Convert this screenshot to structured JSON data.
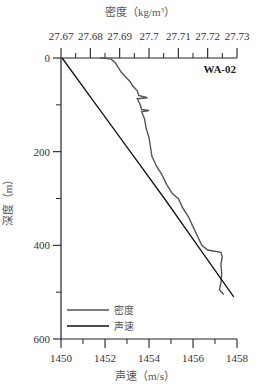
{
  "chart_data": {
    "type": "line",
    "title": "WA-02",
    "station_label": "WA-02",
    "top_axis": {
      "label": "密度（kg/m³）",
      "label_main": "密度（kg/m",
      "label_sup": "3",
      "label_close": "）",
      "ticks": [
        "27.67",
        "27.68",
        "27.69",
        "27.7",
        "27.71",
        "27.72",
        "27.73"
      ],
      "range": [
        27.67,
        27.73
      ]
    },
    "bottom_axis": {
      "label": "声速（m/s）",
      "ticks": [
        "1450",
        "1452",
        "1454",
        "1456",
        "1458"
      ],
      "range": [
        1450,
        1458
      ]
    },
    "y_axis": {
      "label": "深度（m）",
      "ticks": [
        "0",
        "200",
        "400",
        "600"
      ],
      "minor_ticks": [
        100,
        300,
        500
      ],
      "range": [
        0,
        600
      ],
      "inverted": true
    },
    "legend": {
      "position": "lower-left",
      "entries": [
        {
          "name": "密度",
          "color": "#555555"
        },
        {
          "name": "声速",
          "color": "#111111"
        }
      ]
    },
    "series": [
      {
        "name": "密度",
        "axis": "top",
        "color": "#555555",
        "points": [
          {
            "depth": 0,
            "value": 27.6833
          },
          {
            "depth": 2,
            "value": 27.687
          },
          {
            "depth": 10,
            "value": 27.6885
          },
          {
            "depth": 20,
            "value": 27.6895
          },
          {
            "depth": 30,
            "value": 27.6905
          },
          {
            "depth": 40,
            "value": 27.692
          },
          {
            "depth": 50,
            "value": 27.6935
          },
          {
            "depth": 60,
            "value": 27.6945
          },
          {
            "depth": 70,
            "value": 27.696
          },
          {
            "depth": 80,
            "value": 27.6965
          },
          {
            "depth": 85,
            "value": 27.6995
          },
          {
            "depth": 87,
            "value": 27.696
          },
          {
            "depth": 100,
            "value": 27.697
          },
          {
            "depth": 110,
            "value": 27.6975
          },
          {
            "depth": 112,
            "value": 27.7
          },
          {
            "depth": 115,
            "value": 27.6975
          },
          {
            "depth": 130,
            "value": 27.6985
          },
          {
            "depth": 150,
            "value": 27.699
          },
          {
            "depth": 170,
            "value": 27.7
          },
          {
            "depth": 190,
            "value": 27.7005
          },
          {
            "depth": 210,
            "value": 27.701
          },
          {
            "depth": 230,
            "value": 27.7025
          },
          {
            "depth": 250,
            "value": 27.7045
          },
          {
            "depth": 270,
            "value": 27.706
          },
          {
            "depth": 290,
            "value": 27.708
          },
          {
            "depth": 300,
            "value": 27.71
          },
          {
            "depth": 320,
            "value": 27.7115
          },
          {
            "depth": 340,
            "value": 27.7135
          },
          {
            "depth": 360,
            "value": 27.715
          },
          {
            "depth": 380,
            "value": 27.7165
          },
          {
            "depth": 400,
            "value": 27.718
          },
          {
            "depth": 410,
            "value": 27.72
          },
          {
            "depth": 415,
            "value": 27.7245
          },
          {
            "depth": 425,
            "value": 27.725
          },
          {
            "depth": 440,
            "value": 27.7245
          },
          {
            "depth": 460,
            "value": 27.7248
          },
          {
            "depth": 480,
            "value": 27.7245
          },
          {
            "depth": 495,
            "value": 27.724
          },
          {
            "depth": 505,
            "value": 27.7255
          }
        ]
      },
      {
        "name": "声速",
        "axis": "bottom",
        "color": "#111111",
        "points": [
          {
            "depth": 0,
            "value": 1450.05
          },
          {
            "depth": 100,
            "value": 1451.6
          },
          {
            "depth": 200,
            "value": 1453.15
          },
          {
            "depth": 300,
            "value": 1454.7
          },
          {
            "depth": 400,
            "value": 1456.2
          },
          {
            "depth": 500,
            "value": 1457.7
          },
          {
            "depth": 510,
            "value": 1457.85
          }
        ]
      }
    ]
  }
}
